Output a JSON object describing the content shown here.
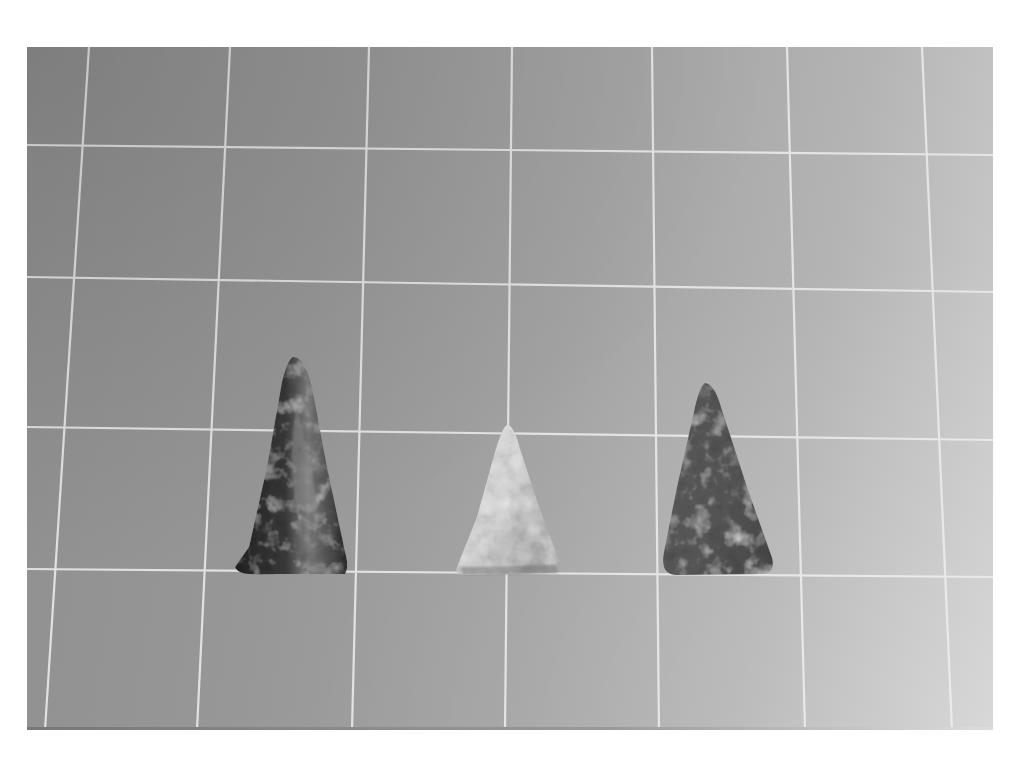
{
  "image": {
    "description": "Grayscale photograph of three triangular stone arrowheads on a gridded background",
    "background": {
      "tone_left": "#8f8f8f",
      "tone_right": "#cfcfcf",
      "grid_line_color": "#e8e8e8"
    },
    "objects": [
      {
        "name": "dark-arrowhead-left",
        "shade": "#2e2e2e",
        "highlight": "#8a8a8a"
      },
      {
        "name": "light-arrowhead-center",
        "shade": "#c9c9c9",
        "highlight": "#e6e6e6"
      },
      {
        "name": "dark-arrowhead-right",
        "shade": "#4a4a4a",
        "highlight": "#6a6a6a"
      }
    ]
  }
}
